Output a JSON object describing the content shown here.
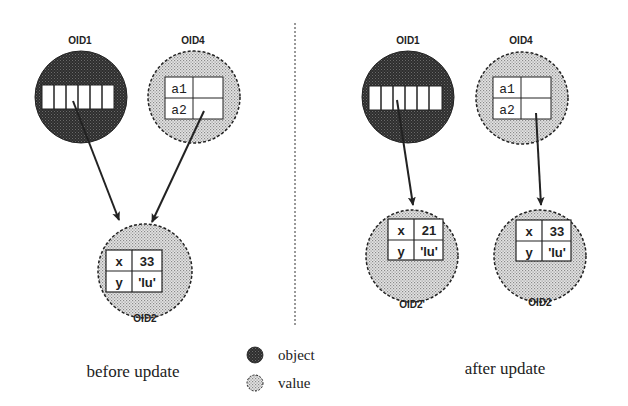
{
  "figure": {
    "colors": {
      "object_fill": "#3a3a3a",
      "value_fill": "#c8c8c8",
      "line": "#222222",
      "background": "#ffffff"
    },
    "before": {
      "caption": "before update",
      "nodes": {
        "oid1": {
          "label": "OID1",
          "kind": "object",
          "slots": 6
        },
        "oid4": {
          "label": "OID4",
          "kind": "value",
          "rows": [
            {
              "key": "a1",
              "val": ""
            },
            {
              "key": "a2",
              "val": ""
            }
          ]
        },
        "oid2": {
          "label": "OID2",
          "kind": "value",
          "rows": [
            {
              "key": "x",
              "val": "33"
            },
            {
              "key": "y",
              "val": "'lu'"
            }
          ]
        }
      },
      "edges": [
        {
          "from": "OID1",
          "to": "OID2"
        },
        {
          "from": "OID4",
          "to": "OID2"
        }
      ]
    },
    "after": {
      "caption": "after update",
      "nodes": {
        "oid1": {
          "label": "OID1",
          "kind": "object",
          "slots": 6
        },
        "oid4": {
          "label": "OID4",
          "kind": "value",
          "rows": [
            {
              "key": "a1",
              "val": ""
            },
            {
              "key": "a2",
              "val": ""
            }
          ]
        },
        "oid2_prime": {
          "label": "OID2'",
          "kind": "value",
          "rows": [
            {
              "key": "x",
              "val": "21"
            },
            {
              "key": "y",
              "val": "'lu'"
            }
          ]
        },
        "oid2": {
          "label": "OID2",
          "kind": "value",
          "rows": [
            {
              "key": "x",
              "val": "33"
            },
            {
              "key": "y",
              "val": "'lu'"
            }
          ]
        }
      },
      "edges": [
        {
          "from": "OID1",
          "to": "OID2'"
        },
        {
          "from": "OID4",
          "to": "OID2"
        }
      ]
    },
    "legend": {
      "object": "object",
      "value": "value"
    }
  }
}
